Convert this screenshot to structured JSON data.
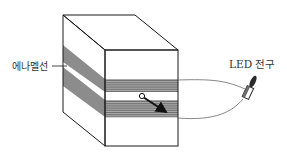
{
  "diagram": {
    "labels": {
      "enamel_wire": "에나멜선",
      "led_bulb": "LED 전구"
    },
    "colors": {
      "outline": "#1a1a1a",
      "coil_band": "#8c8c8c",
      "coil_line": "#5a5a5a",
      "wire": "#555555",
      "led_body": "#2a2a2a",
      "text": "#333333"
    },
    "components": [
      {
        "id": "box",
        "desc": "rectangular box drawn in perspective"
      },
      {
        "id": "coil-upper",
        "desc": "upper band of wound enamel wire"
      },
      {
        "id": "coil-lower",
        "desc": "lower band of wound enamel wire"
      },
      {
        "id": "magnet",
        "desc": "small pivot circle with arrow indicating rotation direction"
      },
      {
        "id": "wire-upper",
        "desc": "lead wire from upper coil to LED"
      },
      {
        "id": "wire-lower",
        "desc": "lead wire from lower coil to LED"
      },
      {
        "id": "led",
        "desc": "LED bulb"
      }
    ]
  }
}
